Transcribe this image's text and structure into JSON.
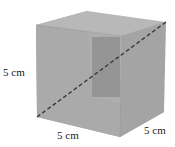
{
  "figure": {
    "colors": {
      "top_face": "#b9b9b9",
      "front_face": "#a9a9a9",
      "right_face": "#a3a3a3",
      "inner_back_face": "#959595",
      "bottom_face": "#a6a6a6",
      "edge": "#9a9a9a",
      "diagonal": "#3a3a3a"
    },
    "labels": {
      "height": "5 cm",
      "width": "5 cm",
      "depth": "5 cm"
    },
    "diagonal": {
      "style": "dashed",
      "description": "space diagonal of the cube"
    }
  }
}
